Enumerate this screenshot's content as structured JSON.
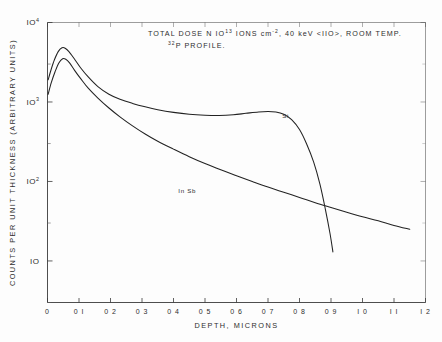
{
  "figure": {
    "title_lines": [
      "TOTAL  DOSE  N  10",
      "32"
    ],
    "title": {
      "l1_a": "TOTAL  DOSE  N  IO",
      "l1_sup": "13",
      "l1_b": " IONS  cm",
      "l1_sup2": "-2",
      "l1_c": ", 40 keV <IIO>, ROOM  TEMP.",
      "l2_sup": "32",
      "l2_a": "P  PROFILE."
    }
  },
  "chart_data": {
    "type": "line",
    "xlabel": "DEPTH,  MICRONS",
    "ylabel": "COUNTS  PER  UNIT  THICKNESS  (ARBITRARY  UNITS)",
    "xlim": [
      0,
      1.2
    ],
    "ylim": [
      3,
      10000
    ],
    "yscale": "log",
    "xscale": "linear",
    "grid": false,
    "legend_position": "inline-annotations",
    "xticks": [
      0,
      0.1,
      0.2,
      0.3,
      0.4,
      0.5,
      0.6,
      0.7,
      0.8,
      0.9,
      1.0,
      1.1,
      1.2
    ],
    "xtick_labels": [
      "0",
      "0 I",
      "0 2",
      "0 3",
      "0 4",
      "0 5",
      "0 6",
      "0 7",
      "0 8",
      "0 9",
      "I 0",
      "I I",
      "I 2"
    ],
    "ytick_values": [
      10000,
      1000,
      100,
      10
    ],
    "ytick_labels": [
      "IO4",
      "IO3",
      "IO2",
      "IO"
    ],
    "ytick_base": [
      "IO",
      "IO",
      "IO",
      "IO"
    ],
    "ytick_exp": [
      "4",
      "3",
      "2",
      ""
    ],
    "yminor_values": [
      3000,
      300,
      30,
      3
    ],
    "series": [
      {
        "name": "Si",
        "label": "Si",
        "label_x": 0.745,
        "label_y": 620,
        "points": [
          [
            0.002,
            1900
          ],
          [
            0.012,
            2600
          ],
          [
            0.022,
            3400
          ],
          [
            0.034,
            4300
          ],
          [
            0.046,
            4800
          ],
          [
            0.056,
            4750
          ],
          [
            0.068,
            4300
          ],
          [
            0.085,
            3500
          ],
          [
            0.105,
            2700
          ],
          [
            0.13,
            2050
          ],
          [
            0.16,
            1560
          ],
          [
            0.195,
            1250
          ],
          [
            0.23,
            1080
          ],
          [
            0.27,
            960
          ],
          [
            0.31,
            870
          ],
          [
            0.35,
            800
          ],
          [
            0.4,
            740
          ],
          [
            0.45,
            700
          ],
          [
            0.5,
            680
          ],
          [
            0.545,
            675
          ],
          [
            0.59,
            690
          ],
          [
            0.63,
            720
          ],
          [
            0.67,
            750
          ],
          [
            0.7,
            760
          ],
          [
            0.725,
            750
          ],
          [
            0.75,
            700
          ],
          [
            0.775,
            600
          ],
          [
            0.8,
            450
          ],
          [
            0.822,
            300
          ],
          [
            0.845,
            175
          ],
          [
            0.865,
            92
          ],
          [
            0.882,
            45
          ],
          [
            0.897,
            22
          ],
          [
            0.906,
            13
          ]
        ]
      },
      {
        "name": "InSb",
        "label": "In Sb",
        "label_x": 0.415,
        "label_y": 72,
        "points": [
          [
            0.002,
            1250
          ],
          [
            0.012,
            1750
          ],
          [
            0.024,
            2400
          ],
          [
            0.036,
            3100
          ],
          [
            0.048,
            3500
          ],
          [
            0.058,
            3450
          ],
          [
            0.07,
            3100
          ],
          [
            0.086,
            2500
          ],
          [
            0.106,
            1950
          ],
          [
            0.13,
            1480
          ],
          [
            0.16,
            1120
          ],
          [
            0.195,
            840
          ],
          [
            0.23,
            650
          ],
          [
            0.27,
            500
          ],
          [
            0.31,
            395
          ],
          [
            0.35,
            320
          ],
          [
            0.4,
            255
          ],
          [
            0.45,
            205
          ],
          [
            0.5,
            168
          ],
          [
            0.55,
            140
          ],
          [
            0.6,
            118
          ],
          [
            0.65,
            100
          ],
          [
            0.7,
            85
          ],
          [
            0.75,
            73
          ],
          [
            0.8,
            63
          ],
          [
            0.85,
            54
          ],
          [
            0.9,
            47
          ],
          [
            0.95,
            41
          ],
          [
            1.0,
            36
          ],
          [
            1.05,
            32
          ],
          [
            1.1,
            28
          ],
          [
            1.15,
            25
          ]
        ]
      }
    ]
  }
}
